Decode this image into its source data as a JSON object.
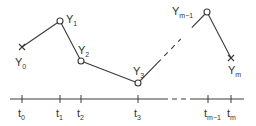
{
  "diagram": {
    "type": "piecewise-linear time series with time axis",
    "colors": {
      "line": "#3a3a3a",
      "text": "#333333",
      "background": "#ffffff"
    },
    "points": [
      {
        "id": "Y0",
        "base": "Y",
        "sub": "0",
        "marker": "x",
        "x": 22,
        "y": 47,
        "lx": 15,
        "ly": 66
      },
      {
        "id": "Y1",
        "base": "Y",
        "sub": "1",
        "marker": "circle",
        "x": 60,
        "y": 21,
        "lx": 66,
        "ly": 23
      },
      {
        "id": "Y2",
        "base": "Y",
        "sub": "2",
        "marker": "circle",
        "x": 81,
        "y": 61,
        "lx": 78,
        "ly": 54
      },
      {
        "id": "Y3",
        "base": "Y",
        "sub": "3",
        "marker": "circle",
        "x": 138,
        "y": 83,
        "lx": 133,
        "ly": 75
      },
      {
        "id": "Ym-1",
        "base": "Y",
        "sub": "m−1",
        "marker": "circle",
        "x": 207,
        "y": 12,
        "lx": 172,
        "ly": 15
      },
      {
        "id": "Ym",
        "base": "Y",
        "sub": "m",
        "marker": "x",
        "x": 231,
        "y": 58,
        "lx": 228,
        "ly": 74
      }
    ],
    "segments": [
      {
        "from": "Y0",
        "to": "Y1",
        "style": "solid"
      },
      {
        "from": "Y1",
        "to": "Y2",
        "style": "solid"
      },
      {
        "from": "Y2",
        "to": "Y3",
        "style": "solid"
      },
      {
        "from": "Y3",
        "to": "Ym-1",
        "style": "solid-then-dashed"
      },
      {
        "from": "Ym-1",
        "to": "Ym",
        "style": "solid"
      }
    ],
    "axis": {
      "y": 99,
      "solid_start": 10,
      "solid_end": 163,
      "dash_start": 163,
      "dash_end": 195,
      "solid2_start": 195,
      "solid2_end": 244,
      "ticks": [
        {
          "base": "t",
          "sub": "0",
          "x": 22
        },
        {
          "base": "t",
          "sub": "1",
          "x": 60
        },
        {
          "base": "t",
          "sub": "2",
          "x": 81
        },
        {
          "base": "t",
          "sub": "3",
          "x": 138
        },
        {
          "base": "t",
          "sub": "m−1",
          "x": 208
        },
        {
          "base": "t",
          "sub": "m",
          "x": 231
        }
      ]
    }
  }
}
